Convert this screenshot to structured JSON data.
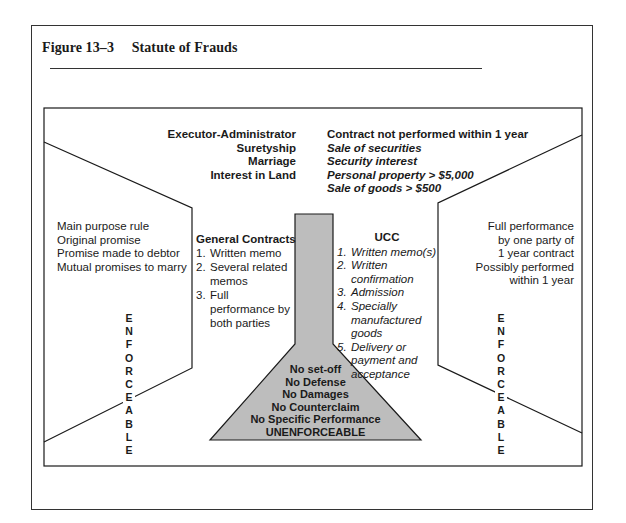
{
  "figure": {
    "number": "Figure 13–3",
    "title": "Statute of Frauds"
  },
  "colors": {
    "funnel_fill": "#bdbdbd",
    "line": "#1a1a1a"
  },
  "top_categories_left": [
    "Executor-Administrator",
    "Suretyship",
    "Marriage",
    "Interest in Land"
  ],
  "top_categories_right": {
    "heading": "Contract not performed within 1 year",
    "items": [
      "Sale of securities",
      "Security interest",
      "Personal property > $5,000",
      "Sale of goods > $500"
    ]
  },
  "left_exceptions": [
    "Main purpose rule",
    "Original promise",
    "Promise made to debtor",
    "Mutual promises to marry"
  ],
  "general_contracts": {
    "heading": "General Contracts",
    "items": [
      {
        "n": "1.",
        "text": "Written memo"
      },
      {
        "n": "2.",
        "text": "Several related memos"
      },
      {
        "n": "3.",
        "text": "Full performance by both parties"
      }
    ]
  },
  "ucc": {
    "heading": "UCC",
    "items": [
      {
        "n": "1.",
        "text": "Written memo(s)"
      },
      {
        "n": "2.",
        "text": "Written confirmation"
      },
      {
        "n": "3.",
        "text": "Admission"
      },
      {
        "n": "4.",
        "text": "Specially manufactured goods"
      },
      {
        "n": "5.",
        "text": "Delivery or payment and acceptance"
      }
    ]
  },
  "right_exceptions": [
    "Full performance",
    "by one party of",
    "1 year contract",
    "Possibly performed",
    "within 1 year"
  ],
  "funnel_consequences": [
    "No set-off",
    "No Defense",
    "No Damages",
    "No Counterclaim",
    "No Specific Performance",
    "UNENFORCEABLE"
  ],
  "side_label_left": "ENFORCEABLE",
  "side_label_right": "ENFORCEABLE"
}
